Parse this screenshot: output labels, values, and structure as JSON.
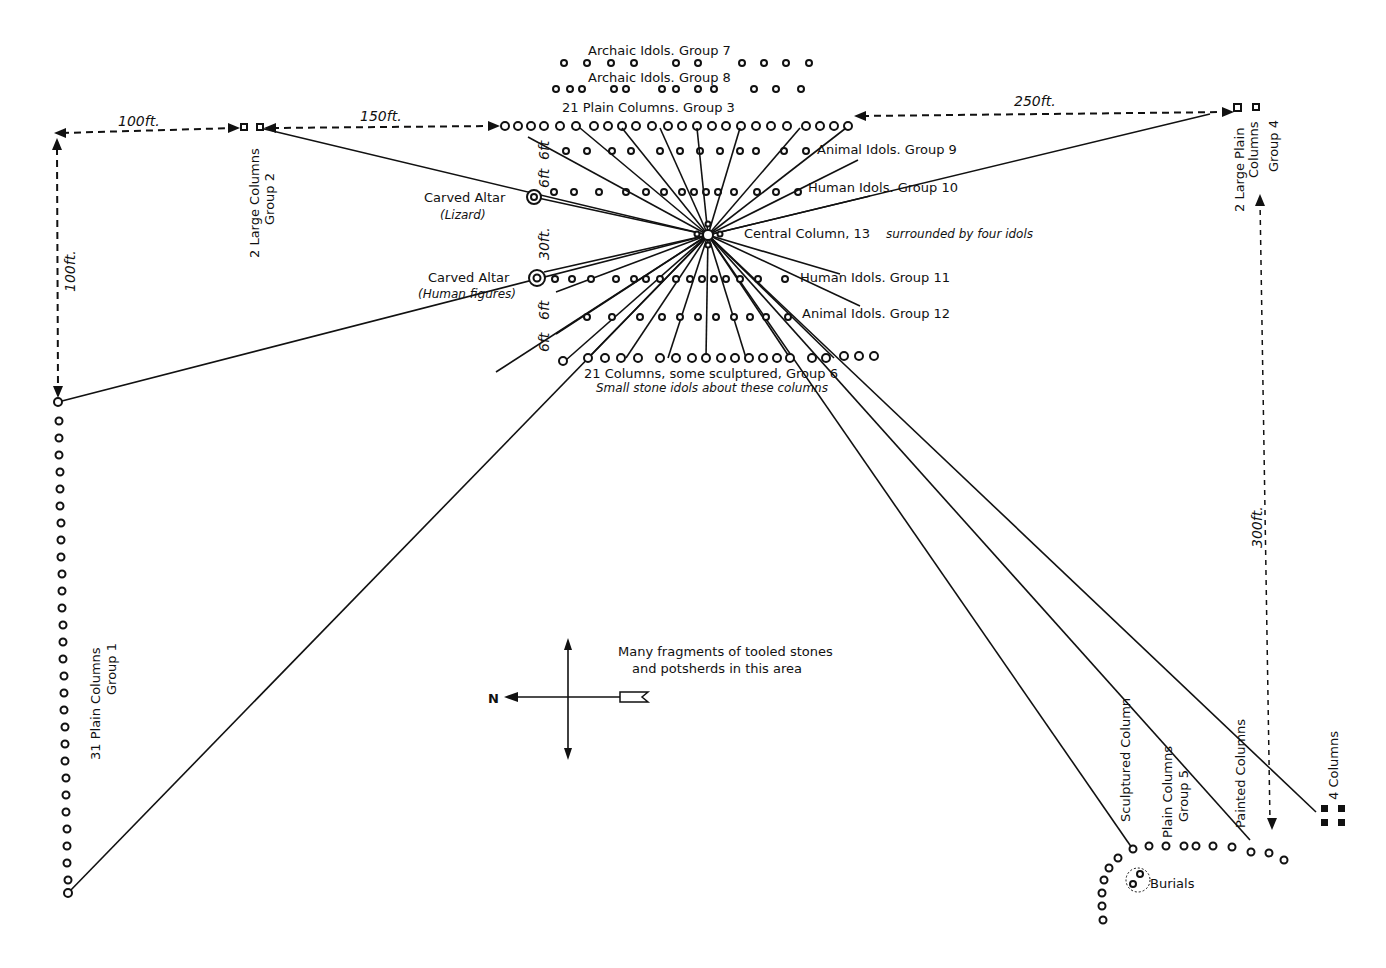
{
  "groups": {
    "group7": "Archaic Idols. Group 7",
    "group8": "Archaic Idols. Group 8",
    "group3": "21 Plain Columns. Group 3",
    "group9": "Animal Idols. Group 9",
    "group10": "Human Idols. Group 10",
    "central": "Central Column, 13",
    "central_note": "surrounded by four idols",
    "group11": "Human Idols. Group 11",
    "group12": "Animal Idols. Group 12",
    "group6": "21 Columns, some sculptured, Group 6",
    "group6_note": "Small stone idols about these columns",
    "group2_line1": "2 Large Columns",
    "group2_line2": "Group 2",
    "group4_line1": "2 Large Plain",
    "group4_line2": "Columns",
    "group4_line3": "Group 4",
    "group1_line1": "31 Plain Columns",
    "group1_line2": "Group 1",
    "altar_lizard": "Carved Altar",
    "altar_lizard_sub": "(Lizard)",
    "altar_human": "Carved Altar",
    "altar_human_sub": "(Human figures)",
    "group5_line1": "Plain Columns",
    "group5_line2": "Group 5",
    "sculptured_column": "Sculptured Column",
    "painted_columns": "Painted Columns",
    "four_columns": "4 Columns",
    "burials": "Burials",
    "fragments_line1": "Many fragments of tooled stones",
    "fragments_line2": "and potsherds in this area"
  },
  "dimensions": {
    "d100_top": "100ft.",
    "d150": "150ft.",
    "d250": "250ft.",
    "d100_left": "100ft.",
    "d300": "300ft.",
    "d6_a": "6ft",
    "d6_b": "6ft",
    "d30": "30ft.",
    "d6_c": "6ft",
    "d6_d": "6ft"
  },
  "compass": {
    "north": "N"
  }
}
